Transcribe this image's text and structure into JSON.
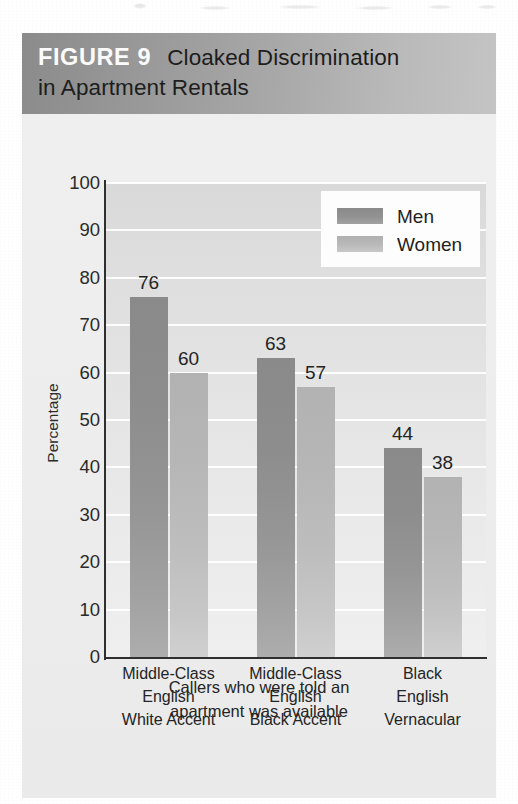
{
  "figure": {
    "tag": "FIGURE 9",
    "title_line1": "Cloaked Discrimination",
    "title_line2": "in Apartment Rentals",
    "caption_line1": "Callers who were told an",
    "caption_line2": "apartment was available"
  },
  "colors": {
    "header_band_dark": "#8b8b8b",
    "header_band_light": "#c4c4c4",
    "men_bar": "#8f8f8f",
    "women_bar": "#bcbcbc",
    "plot_background": "#e2e2e2",
    "gridline": "#ffffff",
    "axis": "#2f2f2f",
    "figure_background": "#ededed"
  },
  "legend": {
    "items": [
      {
        "label": "Men",
        "swatch": "men"
      },
      {
        "label": "Women",
        "swatch": "women"
      }
    ]
  },
  "chart_data": {
    "type": "bar",
    "title": "Cloaked Discrimination in Apartment Rentals",
    "subtitle": "Callers who were told an apartment was available",
    "xlabel": "",
    "ylabel": "Percentage",
    "ylim": [
      0,
      100
    ],
    "yticks": [
      0,
      10,
      20,
      30,
      40,
      50,
      60,
      70,
      80,
      90,
      100
    ],
    "ytick_labels": [
      "0",
      "10",
      "20",
      "30",
      "40",
      "50",
      "60",
      "70",
      "80",
      "90",
      "100"
    ],
    "grid": true,
    "legend_position": "top-right",
    "categories": [
      "Middle-Class English White Accent",
      "Middle-Class English Black Accent",
      "Black English Vernacular"
    ],
    "category_lines": [
      [
        "Middle-Class",
        "English",
        "White Accent"
      ],
      [
        "Middle-Class",
        "English",
        "Black Accent"
      ],
      [
        "Black",
        "English",
        "Vernacular"
      ]
    ],
    "series": [
      {
        "name": "Men",
        "values": [
          76,
          63,
          44
        ]
      },
      {
        "name": "Women",
        "values": [
          60,
          57,
          38
        ]
      }
    ],
    "data_labels": [
      "76",
      "60",
      "63",
      "57",
      "44",
      "38"
    ]
  }
}
